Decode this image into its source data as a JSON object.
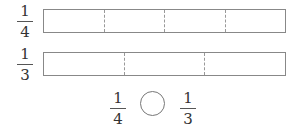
{
  "rows": [
    {
      "fraction": {
        "numerator": "1",
        "denominator": "4"
      },
      "parts": 4
    },
    {
      "fraction": {
        "numerator": "1",
        "denominator": "3"
      },
      "parts": 3
    }
  ],
  "comparison": {
    "left": {
      "numerator": "1",
      "denominator": "4"
    },
    "symbol_answer": "",
    "right": {
      "numerator": "1",
      "denominator": "3"
    }
  },
  "colors": {
    "line": "#888888",
    "divider": "#999999",
    "text": "#333333"
  }
}
